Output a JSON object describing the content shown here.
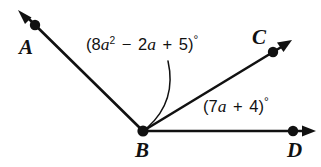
{
  "figure": {
    "kind": "geometry-angle-diagram",
    "background_color": "#ffffff",
    "stroke_color": "#111111",
    "width": 321,
    "height": 167
  },
  "points": [
    {
      "id": "A",
      "label": "A",
      "x": 35,
      "y": 25,
      "label_x": 19,
      "label_y": 37
    },
    {
      "id": "B",
      "label": "B",
      "x": 143,
      "y": 131,
      "label_x": 135,
      "label_y": 140
    },
    {
      "id": "C",
      "label": "C",
      "x": 273,
      "y": 52,
      "label_x": 252,
      "label_y": 27
    },
    {
      "id": "D",
      "label": "D",
      "x": 293,
      "y": 131,
      "label_x": 287,
      "label_y": 140
    }
  ],
  "rays": [
    {
      "id": "ray-BA",
      "from": "B",
      "through": "A",
      "tip_x": 19,
      "tip_y": 11
    },
    {
      "id": "ray-BC",
      "from": "B",
      "through": "C",
      "tip_x": 290,
      "tip_y": 41
    },
    {
      "id": "ray-BD",
      "from": "B",
      "through": "D",
      "tip_x": 314,
      "tip_y": 131
    }
  ],
  "angles": [
    {
      "id": "angle-ABC",
      "name": "angle-abc-label",
      "expression_text": "(8a² − 2a + 5)°",
      "parts": {
        "open_paren": "(",
        "coefficient1": "8",
        "var1": "a",
        "exponent1": "2",
        "operator1": "−",
        "coefficient2": "2",
        "var2": "a",
        "operator2": "+",
        "constant": "5",
        "close_paren": ")",
        "degree": "°"
      },
      "label_x": 86,
      "label_y": 36,
      "leader": {
        "start_x": 168,
        "start_y": 61,
        "ctrl_x": 176,
        "ctrl_y": 100,
        "end_x": 147,
        "end_y": 127
      }
    },
    {
      "id": "angle-CBD",
      "name": "angle-cbd-label",
      "expression_text": "(7a + 4)°",
      "parts": {
        "open_paren": "(",
        "coefficient1": "7",
        "var1": "a",
        "operator2": "+",
        "constant": "4",
        "close_paren": ")",
        "degree": "°"
      },
      "label_x": 203,
      "label_y": 98,
      "leader": null
    }
  ]
}
